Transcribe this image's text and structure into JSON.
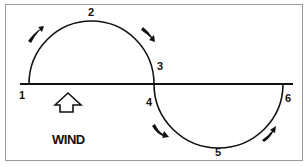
{
  "diagram": {
    "type": "wind-path-diagram",
    "points": [
      {
        "id": "1",
        "label": "1"
      },
      {
        "id": "2",
        "label": "2"
      },
      {
        "id": "3",
        "label": "3"
      },
      {
        "id": "4",
        "label": "4"
      },
      {
        "id": "5",
        "label": "5"
      },
      {
        "id": "6",
        "label": "6"
      }
    ],
    "wind_label": "WIND",
    "icons": {
      "wind_arrow": "up-arrow-outline-icon",
      "direction_arrows": "curved-arrow-icon"
    },
    "colors": {
      "line": "#111111",
      "background": "#ffffff",
      "border": "#9a9a9a"
    }
  }
}
